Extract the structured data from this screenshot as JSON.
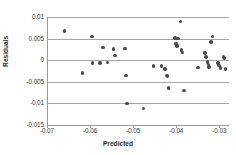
{
  "chart_data": {
    "type": "scatter",
    "title": "",
    "xlabel": "Predicted",
    "ylabel": "Residuals",
    "xlim": [
      -0.07,
      -0.028
    ],
    "ylim": [
      -0.015,
      0.01
    ],
    "xticks": [
      -0.07,
      -0.06,
      -0.05,
      -0.04,
      -0.03
    ],
    "xtick_labels": [
      "-0.07",
      "-0.06",
      "-0.05",
      "-0.04",
      "-0.03"
    ],
    "yticks": [
      0.01,
      0.005,
      0,
      -0.005,
      -0.01,
      -0.015
    ],
    "ytick_labels": [
      "0.01",
      "0.005",
      "0",
      "-0.005",
      "-0.01",
      "-0.015"
    ],
    "grid": "horizontal",
    "legend": "none",
    "marker_color": "#4a4a4a",
    "gridline_color": "#a6a6a6",
    "axis_color": "#9a9a9a",
    "background": "#ffffff",
    "points": [
      {
        "x": -0.0662,
        "y": 0.0068
      },
      {
        "x": -0.062,
        "y": -0.003
      },
      {
        "x": -0.0598,
        "y": 0.0055
      },
      {
        "x": -0.0597,
        "y": -0.0007
      },
      {
        "x": -0.058,
        "y": -0.0007
      },
      {
        "x": -0.0573,
        "y": 0.0029
      },
      {
        "x": -0.0562,
        "y": -0.0005
      },
      {
        "x": -0.0548,
        "y": 0.0026
      },
      {
        "x": -0.0545,
        "y": 0.0011
      },
      {
        "x": -0.0522,
        "y": 0.0027
      },
      {
        "x": -0.0519,
        "y": -0.0035
      },
      {
        "x": -0.0516,
        "y": -0.01
      },
      {
        "x": -0.0478,
        "y": -0.0112
      },
      {
        "x": -0.0455,
        "y": -0.0014
      },
      {
        "x": -0.0437,
        "y": -0.0014
      },
      {
        "x": -0.0428,
        "y": -0.0021
      },
      {
        "x": -0.0424,
        "y": -0.0035
      },
      {
        "x": -0.0423,
        "y": -0.0038
      },
      {
        "x": -0.042,
        "y": -0.0064
      },
      {
        "x": -0.0405,
        "y": 0.0052
      },
      {
        "x": -0.0403,
        "y": 0.0039
      },
      {
        "x": -0.04,
        "y": 0.0033
      },
      {
        "x": -0.0398,
        "y": 0.005
      },
      {
        "x": -0.0393,
        "y": 0.009
      },
      {
        "x": -0.039,
        "y": 0.0023
      },
      {
        "x": -0.0388,
        "y": 0.0018
      },
      {
        "x": -0.0385,
        "y": -0.007
      },
      {
        "x": -0.0352,
        "y": -0.0017
      },
      {
        "x": -0.0336,
        "y": 0.0016
      },
      {
        "x": -0.0333,
        "y": 0.0007
      },
      {
        "x": -0.033,
        "y": -0.0004
      },
      {
        "x": -0.0328,
        "y": -0.001
      },
      {
        "x": -0.0326,
        "y": -0.0016
      },
      {
        "x": -0.0322,
        "y": 0.0042
      },
      {
        "x": -0.0318,
        "y": 0.0055
      },
      {
        "x": -0.0305,
        "y": -0.0006
      },
      {
        "x": -0.0303,
        "y": -0.0012
      },
      {
        "x": -0.03,
        "y": -0.0018
      },
      {
        "x": -0.0293,
        "y": 0.0007
      },
      {
        "x": -0.029,
        "y": 0.0005
      },
      {
        "x": -0.0288,
        "y": -0.002
      }
    ]
  }
}
